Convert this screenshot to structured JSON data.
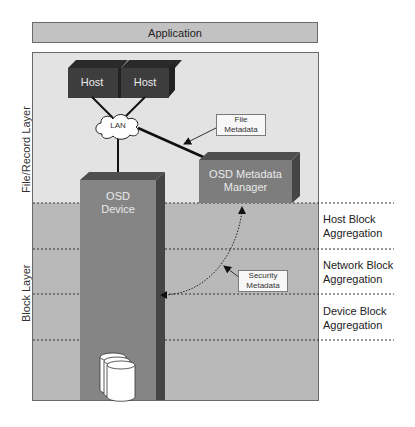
{
  "application_bar": {
    "label": "Application"
  },
  "layers": {
    "file_record": {
      "label": "File/Record Layer"
    },
    "block": {
      "label": "Block Layer"
    }
  },
  "components": {
    "hosts": [
      {
        "label": "Host"
      },
      {
        "label": "Host"
      }
    ],
    "lan": {
      "label": "LAN"
    },
    "osd_device": {
      "line1": "OSD",
      "line2": "Device"
    },
    "osd_metadata_manager": {
      "line1": "OSD Metadata",
      "line2": "Manager"
    },
    "storage": {
      "icon": "disk-stack-icon"
    }
  },
  "callouts": {
    "file_metadata": {
      "line1": "File",
      "line2": "Metadata"
    },
    "security_metadata": {
      "line1": "Security",
      "line2": "Metadata"
    }
  },
  "aggregation_levels": [
    {
      "line1": "Host Block",
      "line2": "Aggregation"
    },
    {
      "line1": "Network Block",
      "line2": "Aggregation"
    },
    {
      "line1": "Device Block",
      "line2": "Aggregation"
    }
  ],
  "colors": {
    "application_bar": "#c2c2c2",
    "file_record_bg": "#e3e3e3",
    "block_bg": "#b9b9b9",
    "host_front": "#3d3d3d",
    "host_top": "#2a2a2a",
    "osd_front": "#7d7d7d",
    "osd_side": "#454545"
  }
}
